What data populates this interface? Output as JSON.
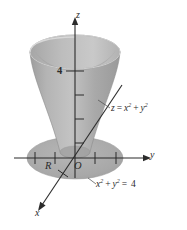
{
  "figure": {
    "kind": "3d-coordinate-diagram",
    "background_color": "#ffffff"
  },
  "axes": {
    "z": {
      "label": "z",
      "direction": "up",
      "arrow": true
    },
    "y": {
      "label": "y",
      "direction": "right",
      "arrow": true
    },
    "x": {
      "label": "x",
      "direction": "lower-left",
      "arrow": true
    },
    "z_tick_labels": [
      {
        "value": "4",
        "axis": "z"
      }
    ],
    "z_tick_count": 4,
    "y_tick_count_left": 2,
    "y_tick_count_right": 2,
    "x_tick_count": 1,
    "axis_color": "#2b2b2b"
  },
  "annotations": {
    "origin_label": "O",
    "region_label": "R",
    "surface_label": {
      "lhs": "z",
      "eq": "=",
      "term1_base": "x",
      "term1_exp": "2",
      "plus": "+",
      "term2_base": "y",
      "term2_exp": "2"
    },
    "circle_label": {
      "term1_base": "x",
      "term1_exp": "2",
      "plus": "+",
      "term2_base": "y",
      "term2_exp": "2",
      "eq": "=",
      "rhs": "4"
    },
    "surface_label_text": "z = x² + y²",
    "circle_label_text": "x² + y² = 4"
  },
  "surface": {
    "shape": "paraboloid-cup",
    "outer_fill": "#a9a9a9",
    "inner_fill": "#b9b9b9",
    "rim_fill": "#c4c4c4",
    "highlight_fill": "#bfbfbf",
    "shadow_fill": "#a3a3a3",
    "disk_fill": "#adadad",
    "edge_color": "#8a8a8a"
  }
}
